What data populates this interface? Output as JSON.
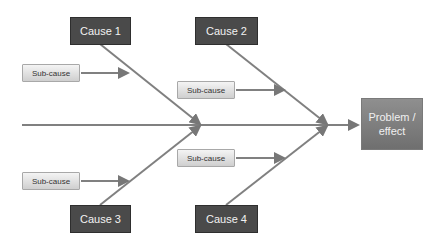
{
  "diagram": {
    "type": "fishbone",
    "causes": [
      {
        "label": "Cause 1"
      },
      {
        "label": "Cause 2"
      },
      {
        "label": "Cause 3"
      },
      {
        "label": "Cause 4"
      }
    ],
    "sub_causes": [
      {
        "label": "Sub-cause"
      },
      {
        "label": "Sub-cause"
      },
      {
        "label": "Sub-cause"
      },
      {
        "label": "Sub-cause"
      }
    ],
    "effect": {
      "line1": "Problem /",
      "line2": "effect"
    },
    "colors": {
      "cause_fill": "#4a4a4a",
      "line": "#777777",
      "effect_fill": "#808080",
      "sub_fill": "#e0e0e0"
    }
  }
}
